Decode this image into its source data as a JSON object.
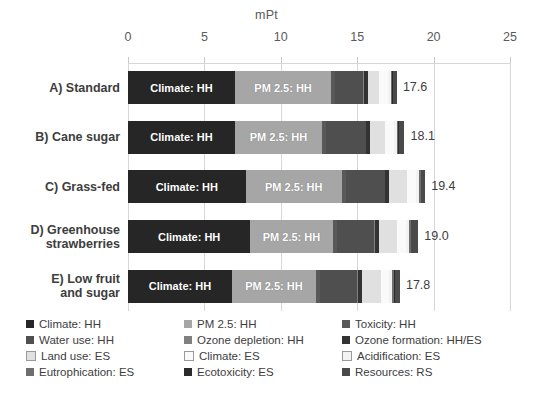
{
  "chart_data": {
    "type": "bar",
    "orientation": "horizontal",
    "stacked": true,
    "title": "",
    "xlabel": "mPt",
    "ylabel": "",
    "xlim": [
      0,
      25
    ],
    "xticks": [
      0,
      5,
      10,
      15,
      20,
      25
    ],
    "xtick_labels": [
      "0",
      "5",
      "10",
      "15",
      "20",
      "25"
    ],
    "grid": true,
    "legend_position": "bottom",
    "categories": [
      "A) Standard",
      "B) Cane sugar",
      "C) Grass-fed",
      "D) Greenhouse strawberries",
      "E) Low fruit and sugar"
    ],
    "category_lines": [
      [
        "A) Standard"
      ],
      [
        "B) Cane sugar"
      ],
      [
        "C) Grass-fed"
      ],
      [
        "D) Greenhouse",
        "strawberries"
      ],
      [
        "E) Low fruit",
        "and sugar"
      ]
    ],
    "totals": [
      17.6,
      18.1,
      19.4,
      19.0,
      17.8
    ],
    "total_labels": [
      "17.6",
      "18.1",
      "19.4",
      "19.0",
      "17.8"
    ],
    "series": [
      {
        "name": "Climate: HH",
        "color": "#262626",
        "values": [
          7.0,
          7.0,
          7.7,
          8.0,
          6.8
        ]
      },
      {
        "name": "PM 2.5: HH",
        "color": "#a6a6a6",
        "values": [
          6.3,
          5.7,
          6.3,
          5.4,
          5.5
        ]
      },
      {
        "name": "Toxicity: HH",
        "color": "#595959",
        "values": [
          0.25,
          0.25,
          0.25,
          0.25,
          0.25
        ]
      },
      {
        "name": "Water use: HH",
        "color": "#4f4f4f",
        "values": [
          1.85,
          2.6,
          2.55,
          2.45,
          2.45
        ]
      },
      {
        "name": "Ozone depletion: HH",
        "color": "#808080",
        "values": [
          0.05,
          0.05,
          0.05,
          0.05,
          0.05
        ]
      },
      {
        "name": "Ozone formation: HH/ES",
        "color": "#333333",
        "values": [
          0.25,
          0.25,
          0.25,
          0.25,
          0.25
        ]
      },
      {
        "name": "Land use: ES",
        "color": "#e0e0e0",
        "values": [
          0.75,
          0.95,
          1.15,
          1.2,
          1.25
        ]
      },
      {
        "name": "Climate: ES",
        "color": "#fafafa",
        "values": [
          0.55,
          0.6,
          0.6,
          0.6,
          0.55
        ]
      },
      {
        "name": "Acidification: ES",
        "color": "#f2f2f2",
        "values": [
          0.2,
          0.2,
          0.2,
          0.2,
          0.2
        ]
      },
      {
        "name": "Eutrophication: ES",
        "color": "#6e6e6e",
        "values": [
          0.1,
          0.1,
          0.1,
          0.1,
          0.1
        ]
      },
      {
        "name": "Ecotoxicity: ES",
        "color": "#2b2b2b",
        "values": [
          0.05,
          0.05,
          0.05,
          0.05,
          0.05
        ]
      },
      {
        "name": "Resources: RS",
        "color": "#4a4a4a",
        "values": [
          0.25,
          0.35,
          0.25,
          0.45,
          0.35
        ]
      }
    ],
    "segment_labels": {
      "Climate: HH": "Climate: HH",
      "PM 2.5: HH": "PM 2.5: HH"
    }
  },
  "legend": {
    "columns": 3,
    "rows": [
      [
        {
          "label": "Climate: HH",
          "color": "#262626",
          "bordered": false
        },
        {
          "label": "PM 2.5: HH",
          "color": "#a6a6a6",
          "bordered": false
        },
        {
          "label": "Toxicity: HH",
          "color": "#595959",
          "bordered": false
        }
      ],
      [
        {
          "label": "Water use: HH",
          "color": "#4f4f4f",
          "bordered": false
        },
        {
          "label": "Ozone depletion: HH",
          "color": "#808080",
          "bordered": false
        },
        {
          "label": "Ozone formation: HH/ES",
          "color": "#333333",
          "bordered": false
        }
      ],
      [
        {
          "label": "Land use: ES",
          "color": "#e0e0e0",
          "bordered": true
        },
        {
          "label": "Climate: ES",
          "color": "#fafafa",
          "bordered": true
        },
        {
          "label": "Acidification: ES",
          "color": "#f2f2f2",
          "bordered": true
        }
      ],
      [
        {
          "label": "Eutrophication: ES",
          "color": "#6e6e6e",
          "bordered": false
        },
        {
          "label": "Ecotoxicity: ES",
          "color": "#2b2b2b",
          "bordered": false
        },
        {
          "label": "Resources: RS",
          "color": "#4a4a4a",
          "bordered": false
        }
      ]
    ]
  },
  "colors": {
    "axis_text": "#5a5a5a",
    "label_text": "#3d3d3d",
    "gridline": "#d7d7d7",
    "background": "#ffffff"
  }
}
